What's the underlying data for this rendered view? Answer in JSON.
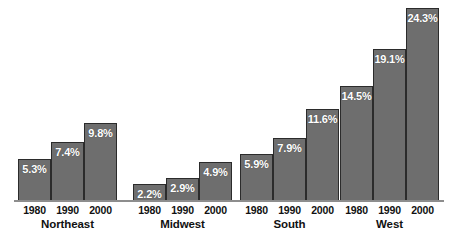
{
  "chart_data": {
    "type": "bar",
    "title": "",
    "subtitle": "",
    "xlabel": "",
    "ylabel": "",
    "grid": false,
    "legend": "none",
    "orientation": "vertical",
    "grouped": true,
    "value_suffix": "%",
    "ylim": [
      0,
      24.3
    ],
    "categories": [
      "Northeast",
      "Midwest",
      "South",
      "West"
    ],
    "x": [
      "1980",
      "1990",
      "2000"
    ],
    "series": [
      {
        "name": "1980",
        "values": [
          5.3,
          2.2,
          5.9,
          14.5
        ]
      },
      {
        "name": "1990",
        "values": [
          7.4,
          2.9,
          7.9,
          19.1
        ]
      },
      {
        "name": "2000",
        "values": [
          9.8,
          4.9,
          11.6,
          24.3
        ]
      }
    ],
    "groups": [
      {
        "region": "Northeast",
        "bars": [
          {
            "year": "1980",
            "value": 5.3,
            "label": "5.3%"
          },
          {
            "year": "1990",
            "value": 7.4,
            "label": "7.4%"
          },
          {
            "year": "2000",
            "value": 9.8,
            "label": "9.8%"
          }
        ]
      },
      {
        "region": "Midwest",
        "bars": [
          {
            "year": "1980",
            "value": 2.2,
            "label": "2.2%"
          },
          {
            "year": "1990",
            "value": 2.9,
            "label": "2.9%"
          },
          {
            "year": "2000",
            "value": 4.9,
            "label": "4.9%"
          }
        ]
      },
      {
        "region": "South",
        "bars": [
          {
            "year": "1980",
            "value": 5.9,
            "label": "5.9%"
          },
          {
            "year": "1990",
            "value": 7.9,
            "label": "7.9%"
          },
          {
            "year": "2000",
            "value": 11.6,
            "label": "11.6%"
          }
        ]
      },
      {
        "region": "West",
        "bars": [
          {
            "year": "1980",
            "value": 14.5,
            "label": "14.5%"
          },
          {
            "year": "1990",
            "value": 19.1,
            "label": "19.1%"
          },
          {
            "year": "2000",
            "value": 24.3,
            "label": "24.3%"
          }
        ]
      }
    ],
    "colors": {
      "bar_fill": "#6e6e6e",
      "bar_border": "#2b2b2b",
      "value_label": "#ffffff",
      "axis_label": "#111111",
      "baseline": "#8d8d8d",
      "background": "#ffffff"
    },
    "layout": {
      "baseline_y": 201,
      "px_per_unit": 7.94,
      "bar_width": 33,
      "group_left": [
        18,
        133,
        240,
        340
      ]
    }
  }
}
